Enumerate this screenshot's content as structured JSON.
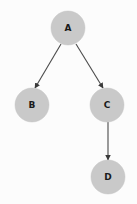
{
  "diagram": {
    "background_color": "#fcfcfc",
    "node_fill_color": "#c9c9c9",
    "node_stroke_color": "#c9c9c9",
    "edge_color": "#4a4a4a",
    "label_color": "#1a1a1a",
    "node_radius": 17,
    "nodes": [
      {
        "id": "A",
        "label": "A",
        "cx": 68,
        "cy": 28,
        "r": 17
      },
      {
        "id": "B",
        "label": "B",
        "cx": 32,
        "cy": 105,
        "r": 17
      },
      {
        "id": "C",
        "label": "C",
        "cx": 107,
        "cy": 105,
        "r": 17
      },
      {
        "id": "D",
        "label": "D",
        "cx": 108,
        "cy": 177,
        "r": 17
      }
    ],
    "edges": [
      {
        "id": "A-B",
        "from": "A",
        "to": "B",
        "x1": 61,
        "y1": 44,
        "x2": 35,
        "y2": 88,
        "directed": true
      },
      {
        "id": "A-C",
        "from": "A",
        "to": "C",
        "x1": 76,
        "y1": 44,
        "x2": 103,
        "y2": 88,
        "directed": true
      },
      {
        "id": "C-D",
        "from": "C",
        "to": "D",
        "x1": 108,
        "y1": 122,
        "x2": 108,
        "y2": 160,
        "directed": true
      }
    ]
  }
}
